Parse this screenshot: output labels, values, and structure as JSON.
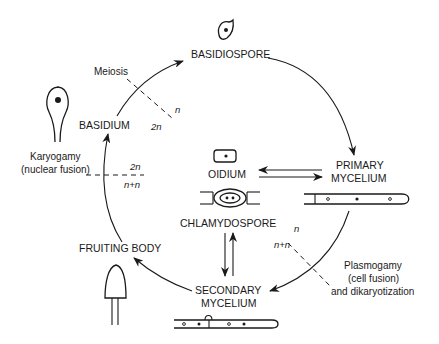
{
  "diagram": {
    "stages": {
      "basidiospore": "BASIDIOSPORE",
      "primary_mycelium_line1": "PRIMARY",
      "primary_mycelium_line2": "MYCELIUM",
      "secondary_mycelium_line1": "SECONDARY",
      "secondary_mycelium_line2": "MYCELIUM",
      "fruiting_body": "FRUITING BODY",
      "basidium": "BASIDIUM",
      "oidium": "OIDIUM",
      "chlamydospore": "CHLAMYDOSPORE"
    },
    "events": {
      "meiosis": "Meiosis",
      "karyogamy_line1": "Karyogamy",
      "karyogamy_line2": "(nuclear fusion)",
      "plasmogamy_line1": "Plasmogamy",
      "plasmogamy_line2": "(cell fusion)",
      "plasmogamy_line3": "and dikaryotization"
    },
    "ploidy": {
      "meiosis_after": "n",
      "meiosis_before": "2n",
      "karyogamy_after": "2n",
      "karyogamy_before": "n+n",
      "plasmogamy_before": "n",
      "plasmogamy_after": "n+n"
    },
    "colors": {
      "ink": "#1a1a1a",
      "background": "#ffffff"
    }
  }
}
